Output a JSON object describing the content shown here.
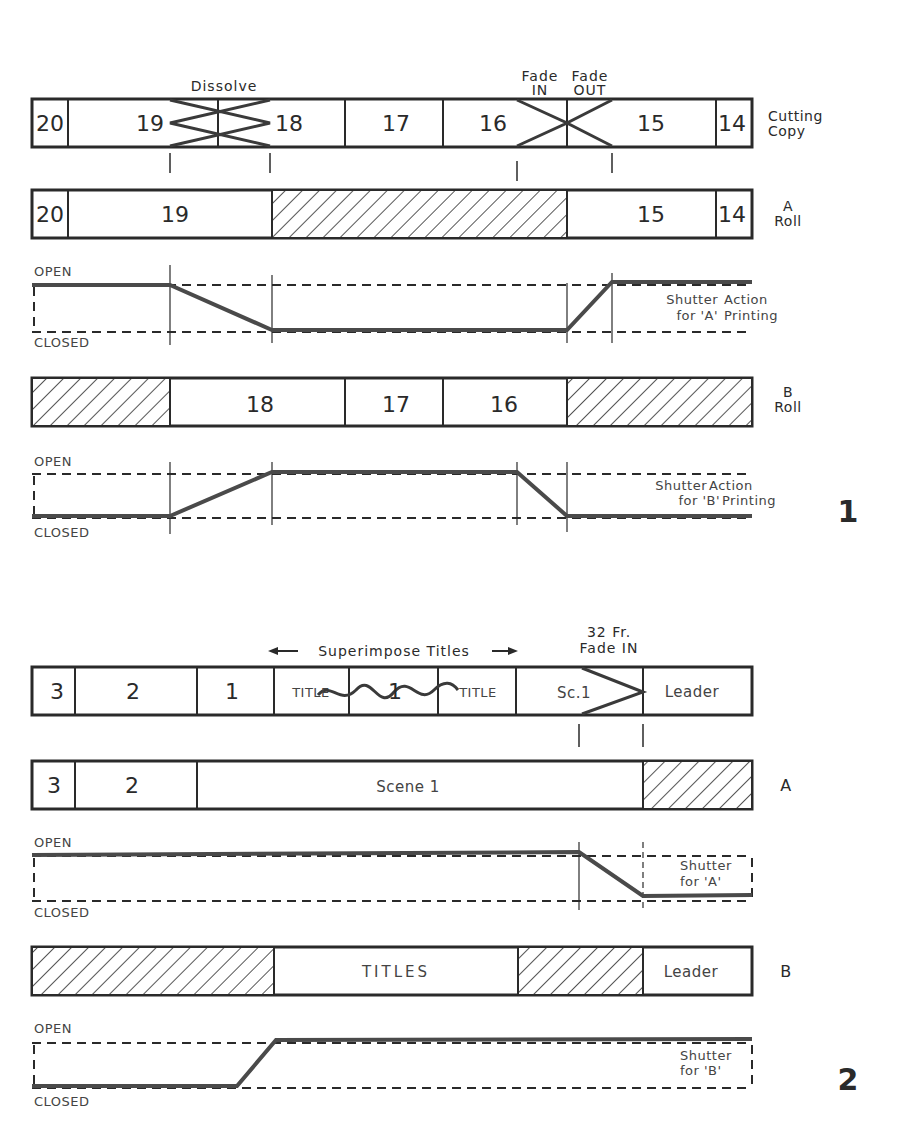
{
  "figure1": {
    "number": "1",
    "annotations": {
      "dissolve": "Dissolve",
      "fade_in_1": "Fade",
      "fade_in_2": "IN",
      "fade_out_1": "Fade",
      "fade_out_2": "OUT"
    },
    "cutting_copy": {
      "label_1": "Cutting",
      "label_2": "Copy",
      "cells": [
        "20",
        "19",
        "18",
        "17",
        "16",
        "15",
        "14"
      ]
    },
    "a_roll": {
      "label_1": "A",
      "label_2": "Roll",
      "cells": [
        "20",
        "19",
        "15",
        "14"
      ]
    },
    "a_shutter": {
      "open": "OPEN",
      "closed": "CLOSED",
      "label_1": "Shutter",
      "label_2": "Action",
      "label_3": "for 'A'",
      "label_4": "Printing"
    },
    "b_roll": {
      "label_1": "B",
      "label_2": "Roll",
      "cells": [
        "18",
        "17",
        "16"
      ]
    },
    "b_shutter": {
      "open": "OPEN",
      "closed": "CLOSED",
      "label_1": "Shutter",
      "label_2": "Action",
      "label_3": "for 'B'",
      "label_4": "Printing"
    }
  },
  "figure2": {
    "number": "2",
    "annotations": {
      "superimpose": "Superimpose Titles",
      "fade_1": "32 Fr.",
      "fade_2": "Fade IN"
    },
    "cutting_copy": {
      "cells": [
        "3",
        "2",
        "1",
        "TITLE",
        "1",
        "TITLE",
        "Sc.1",
        "Leader"
      ]
    },
    "a_roll": {
      "label": "A",
      "cells": [
        "3",
        "2",
        "Scene 1"
      ]
    },
    "a_shutter": {
      "open": "OPEN",
      "closed": "CLOSED",
      "label_1": "Shutter",
      "label_2": "for 'A'"
    },
    "b_roll": {
      "label": "B",
      "cells": [
        "TITLES",
        "Leader"
      ]
    },
    "b_shutter": {
      "open": "OPEN",
      "closed": "CLOSED",
      "label_1": "Shutter",
      "label_2": "for 'B'"
    }
  }
}
